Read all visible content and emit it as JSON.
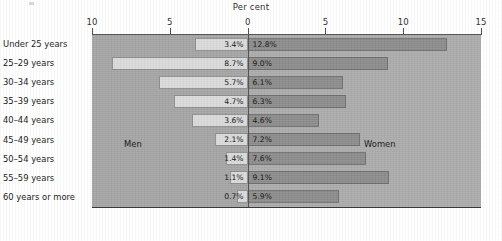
{
  "chart_data": {
    "type": "bar",
    "subtype": "diverging-population-pyramid",
    "title": "",
    "axis_title": "Per cent",
    "xlabel": "Per cent",
    "ylabel": "",
    "orientation": "horizontal",
    "grid": false,
    "legend_position": "in-plot",
    "categories": [
      "Under 25 years",
      "25–29 years",
      "30–34 years",
      "35–39 years",
      "40–44 years",
      "45–49 years",
      "50–54 years",
      "55–59 years",
      "60 years or more"
    ],
    "series": [
      {
        "name": "Men",
        "side": "left",
        "color": "#d9d9d9",
        "values": [
          3.4,
          8.7,
          5.7,
          4.7,
          3.6,
          2.1,
          1.4,
          1.1,
          0.7
        ],
        "labels": [
          "3.4%",
          "8.7%",
          "5.7%",
          "4.7%",
          "3.6%",
          "2.1%",
          "1.4%",
          "1.1%",
          "0.7%"
        ]
      },
      {
        "name": "Women",
        "side": "right",
        "color": "#8b8b8b",
        "values": [
          12.8,
          9.0,
          6.1,
          6.3,
          4.6,
          7.2,
          7.6,
          9.1,
          5.9
        ],
        "labels": [
          "12.8%",
          "9.0%",
          "6.1%",
          "6.3%",
          "4.6%",
          "7.2%",
          "7.6%",
          "9.1%",
          "5.9%"
        ]
      }
    ],
    "axis": {
      "left_max": 10,
      "right_max": 15,
      "tick_values": [
        10,
        5,
        0,
        5,
        10,
        15
      ],
      "tick_labels": [
        "10",
        "5",
        "0",
        "5",
        "10",
        "15"
      ]
    },
    "annotations": [
      {
        "text": "Men",
        "side": "left"
      },
      {
        "text": "Women",
        "side": "right"
      }
    ]
  }
}
